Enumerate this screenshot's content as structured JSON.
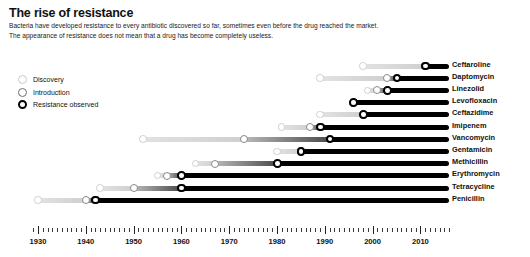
{
  "header": {
    "title": "The rise of resistance",
    "subtitle_line1": "Bacteria have developed resistance to every antibiotic discovered so far, sometimes even before the drug reached the market.",
    "subtitle_line2": "The appearance of resistance does not mean that a drug has become completely useless."
  },
  "legend": {
    "position": "top-left",
    "items": [
      {
        "key": "discovery",
        "label": "Discovery",
        "marker": "open-circle-light",
        "color": "#cfcfcf"
      },
      {
        "key": "introduction",
        "label": "Introduction",
        "marker": "open-circle-mid",
        "color": "#8a8a8a"
      },
      {
        "key": "resistance",
        "label": "Resistance observed",
        "marker": "open-circle-bold",
        "color": "#000000"
      }
    ]
  },
  "chart_data": {
    "type": "bar",
    "subtype": "timeline-gantt",
    "title": "The rise of resistance",
    "xlabel": "",
    "ylabel": "",
    "xlim": [
      1928,
      2016
    ],
    "grid": false,
    "axis_ticks_major": [
      1930,
      1940,
      1950,
      1960,
      1970,
      1980,
      1990,
      2000,
      2010
    ],
    "axis_tick_labels": [
      "1930",
      "1940",
      "1950",
      "1960",
      "1970",
      "1980",
      "1990",
      "2000",
      "2010"
    ],
    "axis_minor_tick_step": 1,
    "series": [
      {
        "name": "Discovery",
        "color": "#cfcfcf"
      },
      {
        "name": "Introduction",
        "color": "#8a8a8a"
      },
      {
        "name": "Resistance observed",
        "color": "#000000"
      }
    ],
    "categories": [
      "Ceftaroline",
      "Daptomycin",
      "Linezolid",
      "Levofloxacin",
      "Ceftazidime",
      "Imipenem",
      "Vancomycin",
      "Gentamicin",
      "Methicillin",
      "Erythromycin",
      "Tetracycline",
      "Penicillin"
    ],
    "rows": [
      {
        "label": "Ceftaroline",
        "discovery": 1998,
        "introduction": 2011,
        "resistance": 2011,
        "end": 2016
      },
      {
        "label": "Daptomycin",
        "discovery": 1989,
        "introduction": 2003,
        "resistance": 2005,
        "end": 2016
      },
      {
        "label": "Linezolid",
        "discovery": 1999,
        "introduction": 2001,
        "resistance": 2003,
        "end": 2016
      },
      {
        "label": "Levofloxacin",
        "discovery": 1996,
        "introduction": 1996,
        "resistance": 1996,
        "end": 2016
      },
      {
        "label": "Ceftazidime",
        "discovery": 1989,
        "introduction": 1998,
        "resistance": 1998,
        "end": 2016
      },
      {
        "label": "Imipenem",
        "discovery": 1981,
        "introduction": 1987,
        "resistance": 1989,
        "end": 2016
      },
      {
        "label": "Vancomycin",
        "discovery": 1952,
        "introduction": 1973,
        "resistance": 1991,
        "end": 2016
      },
      {
        "label": "Gentamicin",
        "discovery": 1980,
        "introduction": 1985,
        "resistance": 1985,
        "end": 2016
      },
      {
        "label": "Methicillin",
        "discovery": 1963,
        "introduction": 1967,
        "resistance": 1980,
        "end": 2016
      },
      {
        "label": "Erythromycin",
        "discovery": 1955,
        "introduction": 1957,
        "resistance": 1960,
        "end": 2016
      },
      {
        "label": "Tetracycline",
        "discovery": 1943,
        "introduction": 1950,
        "resistance": 1960,
        "end": 2016
      },
      {
        "label": "Penicillin",
        "discovery": 1930,
        "introduction": 1940,
        "resistance": 1942,
        "end": 2016
      }
    ]
  }
}
